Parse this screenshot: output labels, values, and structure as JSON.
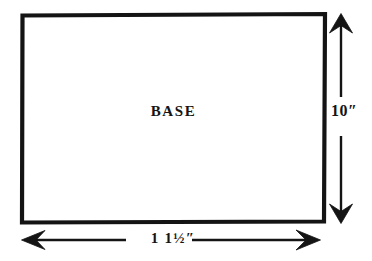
{
  "diagram": {
    "title": "BASE",
    "shape": "rectangle",
    "stroke_color": "#141414",
    "fill_color": "#ffffff",
    "background_color": "#ffffff",
    "base_label": "BASE",
    "height_label": "10″",
    "width_label": "1 1½″",
    "height_value": "10",
    "width_value": "11.5",
    "units": "inches",
    "rect": {
      "x": 22,
      "y": 14,
      "width": 303,
      "height": 208,
      "stroke_width": 4
    },
    "height_arrow": {
      "name": "vertical-dimension-arrow",
      "x": 341,
      "top": 14,
      "bottom": 223,
      "double_headed": true,
      "label_gap_top": 97,
      "label_gap_bottom": 136
    },
    "width_arrow": {
      "name": "horizontal-dimension-arrow",
      "y": 240,
      "left": 22,
      "right": 320,
      "double_headed": true,
      "label_gap_left": 126,
      "label_gap_right": 192
    }
  }
}
